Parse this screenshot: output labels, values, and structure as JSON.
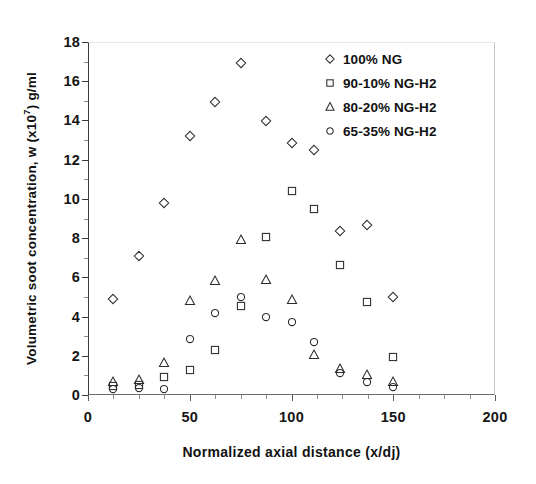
{
  "chart_data": {
    "type": "scatter",
    "title": "",
    "xlabel": "Normalized axial distance (x/dj)",
    "ylabel_prefix": "Volumetric soot concentration, w (x10",
    "ylabel_exponent": "7",
    "ylabel_suffix": ") g/ml",
    "xlim": [
      0,
      200
    ],
    "ylim": [
      0,
      18
    ],
    "xticks": [
      0,
      50,
      100,
      150,
      200
    ],
    "yticks": [
      0,
      2,
      4,
      6,
      8,
      10,
      12,
      14,
      16,
      18
    ],
    "x_minor_step": 12.5,
    "y_minor_step": 1,
    "grid": false,
    "legend_position": "top-right",
    "series": [
      {
        "name": "100% NG",
        "marker": "diamond",
        "color": "#2b2b2b",
        "points": [
          [
            12.5,
            4.9
          ],
          [
            25.0,
            7.1
          ],
          [
            37.5,
            9.8
          ],
          [
            50.0,
            13.2
          ],
          [
            62.5,
            14.95
          ],
          [
            75.0,
            16.95
          ],
          [
            87.5,
            13.95
          ],
          [
            100.0,
            12.85
          ],
          [
            111.0,
            12.5
          ],
          [
            124.0,
            8.35
          ],
          [
            137.0,
            8.65
          ],
          [
            150.0,
            4.98
          ]
        ]
      },
      {
        "name": "90-10% NG-H2",
        "marker": "square",
        "color": "#2b2b2b",
        "points": [
          [
            12.5,
            0.45
          ],
          [
            25.0,
            0.5
          ],
          [
            37.5,
            0.9
          ],
          [
            50.0,
            1.28
          ],
          [
            62.5,
            2.28
          ],
          [
            75.0,
            4.55
          ],
          [
            87.5,
            8.05
          ],
          [
            100.0,
            10.4
          ],
          [
            111.0,
            9.48
          ],
          [
            124.0,
            6.65
          ],
          [
            137.0,
            4.72
          ],
          [
            150.0,
            1.95
          ]
        ]
      },
      {
        "name": "80-20% NG-H2",
        "marker": "triangle",
        "color": "#2b2b2b",
        "points": [
          [
            12.5,
            0.68
          ],
          [
            25.0,
            0.75
          ],
          [
            37.5,
            1.62
          ],
          [
            50.0,
            4.8
          ],
          [
            62.5,
            5.8
          ],
          [
            75.0,
            7.9
          ],
          [
            87.5,
            5.88
          ],
          [
            100.0,
            4.82
          ],
          [
            111.0,
            2.05
          ],
          [
            124.0,
            1.32
          ],
          [
            137.0,
            1.02
          ],
          [
            150.0,
            0.65
          ]
        ]
      },
      {
        "name": "65-35% NG-H2",
        "marker": "circle",
        "color": "#2b2b2b",
        "points": [
          [
            12.5,
            0.32
          ],
          [
            25.0,
            0.38
          ],
          [
            37.5,
            0.3
          ],
          [
            50.0,
            2.85
          ],
          [
            62.5,
            4.18
          ],
          [
            75.0,
            5.0
          ],
          [
            87.5,
            3.98
          ],
          [
            100.0,
            3.7
          ],
          [
            111.0,
            2.68
          ],
          [
            124.0,
            1.12
          ],
          [
            137.0,
            0.66
          ],
          [
            150.0,
            0.4
          ]
        ]
      }
    ]
  },
  "legend": {
    "items": [
      {
        "label": "100% NG",
        "marker": "diamond"
      },
      {
        "label": "90-10% NG-H2",
        "marker": "square"
      },
      {
        "label": "80-20% NG-H2",
        "marker": "triangle"
      },
      {
        "label": "65-35% NG-H2",
        "marker": "circle"
      }
    ]
  }
}
